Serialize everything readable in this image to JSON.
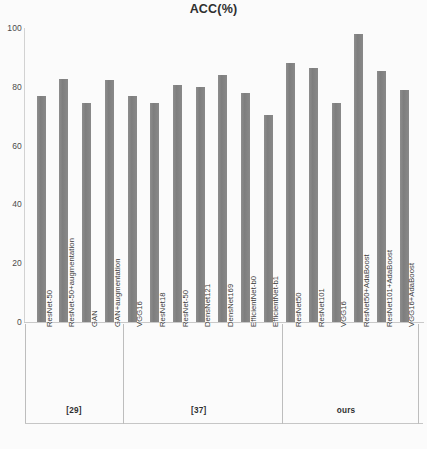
{
  "chart_data": {
    "type": "bar",
    "title": "ACC(%)",
    "xlabel": "",
    "ylabel": "",
    "ylim": [
      0,
      100
    ],
    "yticks": [
      0,
      20,
      40,
      60,
      80,
      100
    ],
    "grid": false,
    "legend": "none",
    "bar_color": "#878787",
    "categories": [
      "ResNet-50",
      "ResNet-50+augmentation",
      "GAN",
      "GAN+augmentation",
      "VGG16",
      "ResNet18",
      "ResNet-50",
      "DensNet121",
      "DensNet169",
      "EfficientNet-b0",
      "EfficientNet-b1",
      "ResNet50",
      "ResNet101",
      "VGG16",
      "ResNet50+AdaBoost",
      "ResNet101+AdaBoost",
      "VGG16+AdaBoost"
    ],
    "values": [
      77,
      82.5,
      74.5,
      82.3,
      77,
      74.5,
      80.5,
      80,
      84,
      78,
      70.5,
      88,
      86.5,
      74.5,
      98,
      85.5,
      79
    ],
    "groups": [
      {
        "label": "[29]",
        "start_index": 0,
        "end_index": 3
      },
      {
        "label": "[37]",
        "start_index": 4,
        "end_index": 10
      },
      {
        "label": "ours",
        "start_index": 11,
        "end_index": 16
      }
    ]
  }
}
